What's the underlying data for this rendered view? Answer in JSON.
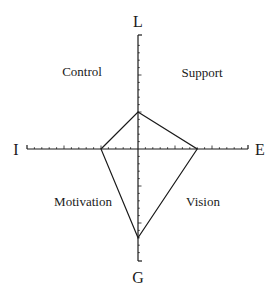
{
  "chart_data": {
    "type": "radar",
    "title": "",
    "axes": [
      {
        "name": "L",
        "direction": "up",
        "value": 5
      },
      {
        "name": "E",
        "direction": "right",
        "value": 8
      },
      {
        "name": "G",
        "direction": "down",
        "value": 12
      },
      {
        "name": "I",
        "direction": "left",
        "value": 5
      }
    ],
    "axis_range": [
      0,
      15
    ],
    "tick_minor": 1,
    "tick_major": 5,
    "quadrants": [
      {
        "name": "Control",
        "between": [
          "L",
          "I"
        ]
      },
      {
        "name": "Support",
        "between": [
          "L",
          "E"
        ]
      },
      {
        "name": "Motivation",
        "between": [
          "G",
          "I"
        ]
      },
      {
        "name": "Vision",
        "between": [
          "G",
          "E"
        ]
      }
    ],
    "grid": false,
    "legend": null
  },
  "labels": {
    "top": "L",
    "bottom": "G",
    "left": "I",
    "right": "E",
    "q_top_left": "Control",
    "q_top_right": "Support",
    "q_bottom_left": "Motivation",
    "q_bottom_right": "Vision"
  },
  "colors": {
    "stroke": "#1a1a1a",
    "background": "#ffffff"
  }
}
